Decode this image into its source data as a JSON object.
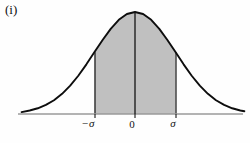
{
  "figure": {
    "label": "(i)",
    "caption": ""
  },
  "colors": {
    "background": "#fefefe",
    "curve": "#0d0d0d",
    "fill": "#c0c0c0",
    "axis": "#9a9a9a",
    "center_line": "#141414",
    "tick_text": "#121212"
  },
  "axis": {
    "x_start": 18,
    "x_end": 243,
    "baseline_y": 114,
    "ticks": [
      {
        "name": "minus-sigma",
        "label": "−σ",
        "x": 95,
        "label_x": 88,
        "label_y": 127,
        "italic": true
      },
      {
        "name": "zero",
        "label": "0",
        "x": 135,
        "label_x": 132,
        "label_y": 128,
        "italic": false
      },
      {
        "name": "sigma",
        "label": "σ",
        "x": 176,
        "label_x": 173,
        "label_y": 127,
        "italic": true
      }
    ]
  },
  "chart_data": {
    "type": "area",
    "title": "(i)",
    "subtitle": "",
    "xlabel": "",
    "ylabel": "",
    "grid": false,
    "legend_position": "none",
    "distribution": "normal",
    "mean": 0,
    "std_dev": 1,
    "xlim": [
      -2.8,
      2.7
    ],
    "ylim": [
      0,
      1
    ],
    "x_tick_values": [
      -1,
      0,
      1
    ],
    "x_tick_labels": [
      "−σ",
      "0",
      "σ"
    ],
    "shaded_interval": [
      -1,
      1
    ],
    "shaded_label": "area between −σ and σ",
    "center_line_x": 0,
    "annotations": [
      {
        "text": "(i)",
        "x": -2.75,
        "y": 0.97
      }
    ],
    "x": [
      -2.8,
      -2.6,
      -2.4,
      -2.2,
      -2.0,
      -1.8,
      -1.6,
      -1.4,
      -1.2,
      -1.0,
      -0.8,
      -0.6,
      -0.4,
      -0.2,
      0.0,
      0.2,
      0.4,
      0.6,
      0.8,
      1.0,
      1.2,
      1.4,
      1.6,
      1.8,
      2.0,
      2.2,
      2.4,
      2.6,
      2.7
    ],
    "y": [
      0.019,
      0.034,
      0.056,
      0.089,
      0.135,
      0.198,
      0.278,
      0.375,
      0.487,
      0.607,
      0.726,
      0.835,
      0.923,
      0.98,
      1.0,
      0.98,
      0.923,
      0.835,
      0.726,
      0.607,
      0.487,
      0.375,
      0.278,
      0.198,
      0.135,
      0.089,
      0.056,
      0.034,
      0.027
    ]
  }
}
